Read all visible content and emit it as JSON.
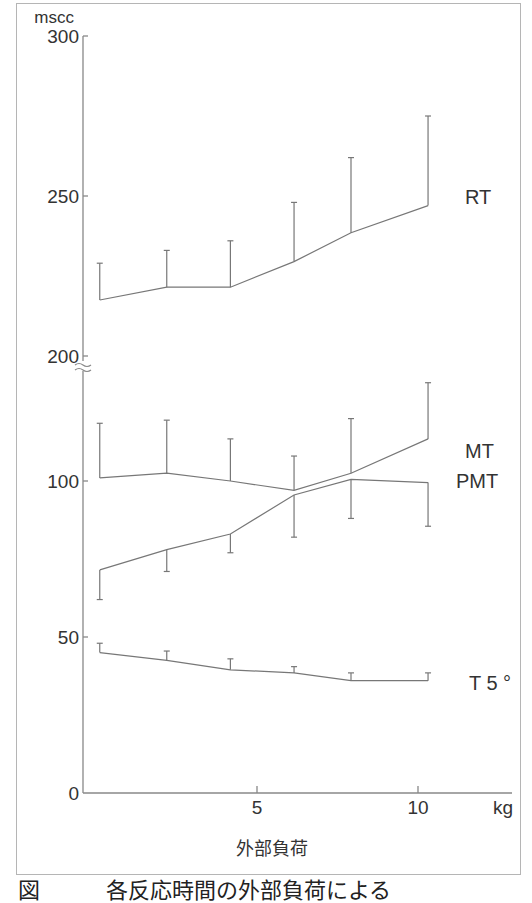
{
  "figure": {
    "y_unit_label": "mscc",
    "x_unit_label": "kg",
    "x_axis_title": "外部負荷",
    "caption_clipped": "図　　　各反応時間の外部負荷による"
  },
  "chart_data": {
    "type": "line",
    "title": "",
    "xlabel": "外部負荷 (kg)",
    "ylabel": "mscc",
    "x_ticks": [
      0,
      5,
      10
    ],
    "y_ticks_lower": [
      0,
      50,
      100
    ],
    "y_ticks_upper": [
      200,
      250,
      300
    ],
    "axis_break": "between 100 and 200 (broken axis symbol at ~200)",
    "ylim": [
      0,
      300
    ],
    "xlim": [
      0,
      12
    ],
    "grid": false,
    "legend": "inline labels at right end of each series",
    "error_bars": "one-sided (SD)",
    "x": [
      0.5,
      2.5,
      4.4,
      6.3,
      8.0,
      10.3
    ],
    "series": [
      {
        "name": "RT",
        "values": [
          217.5,
          221.5,
          221.5,
          229.5,
          238.5,
          247
        ],
        "error_top": [
          229,
          233,
          236,
          248,
          262,
          275
        ],
        "error_direction": "up"
      },
      {
        "name": "MT",
        "values": [
          101,
          102.5,
          100,
          97,
          102.5,
          113.5
        ],
        "error_top": [
          118.5,
          119.5,
          113.5,
          108,
          120,
          131.5
        ],
        "error_direction": "up"
      },
      {
        "name": "PMT",
        "values": [
          71.5,
          78,
          83,
          95.5,
          100.5,
          99.5
        ],
        "error_bottom": [
          62,
          71,
          77,
          82,
          88,
          85.5
        ],
        "error_direction": "down"
      },
      {
        "name": "T 5 °",
        "values": [
          45,
          42.5,
          39.5,
          38.5,
          36,
          36
        ],
        "error_top": [
          48,
          45.5,
          43,
          40.5,
          38.5,
          38.5
        ],
        "error_direction": "up"
      }
    ]
  },
  "labels": {
    "y300": "300",
    "y250": "250",
    "y200": "200",
    "y100": "100",
    "y50": "50",
    "y0": "0",
    "x5": "5",
    "x10": "10",
    "rt": "RT",
    "mt": "MT",
    "pmt": "PMT",
    "t5": "T 5 °"
  }
}
